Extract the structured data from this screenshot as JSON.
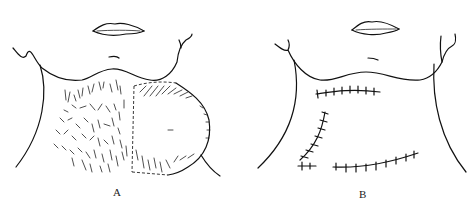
{
  "figure": {
    "panels": [
      {
        "id": "A",
        "label": "A",
        "description": "Neck with hairy skin graft area and flap outlined by dashed incision line"
      },
      {
        "id": "B",
        "label": "B",
        "description": "Neck after flap transposition with sutured incision lines"
      }
    ]
  }
}
